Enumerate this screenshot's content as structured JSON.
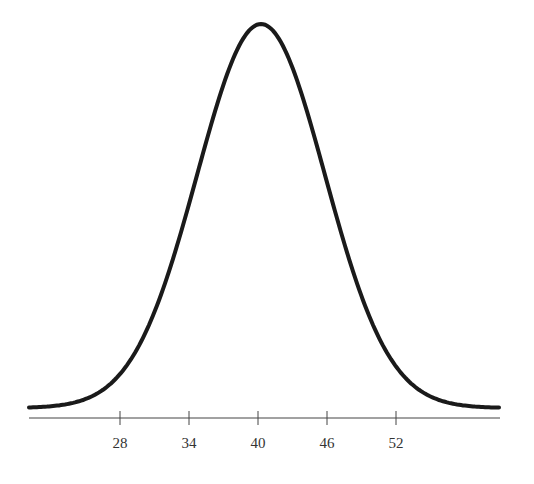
{
  "chart_data": {
    "type": "line",
    "title": "",
    "xlabel": "",
    "ylabel": "",
    "grid": false,
    "legend": null,
    "mean": 40,
    "std_dev": 6,
    "x_ticks": [
      28,
      34,
      40,
      46,
      52
    ],
    "x_tick_labels": [
      "28",
      "34",
      "40",
      "46",
      "52"
    ],
    "xlim": [
      19,
      60
    ],
    "series": [
      {
        "name": "normal-curve",
        "x": [
          19,
          22,
          25,
          28,
          31,
          34,
          37,
          40,
          43,
          46,
          49,
          52,
          55,
          58,
          60
        ],
        "y": [
          0.0014,
          0.0036,
          0.0088,
          0.018,
          0.0324,
          0.0484,
          0.0605,
          0.0665,
          0.0605,
          0.0484,
          0.0324,
          0.018,
          0.0088,
          0.0036,
          0.0014
        ]
      }
    ],
    "colors": {
      "curve": "#1a1a1a",
      "axis": "#444444",
      "text": "#333333"
    }
  }
}
